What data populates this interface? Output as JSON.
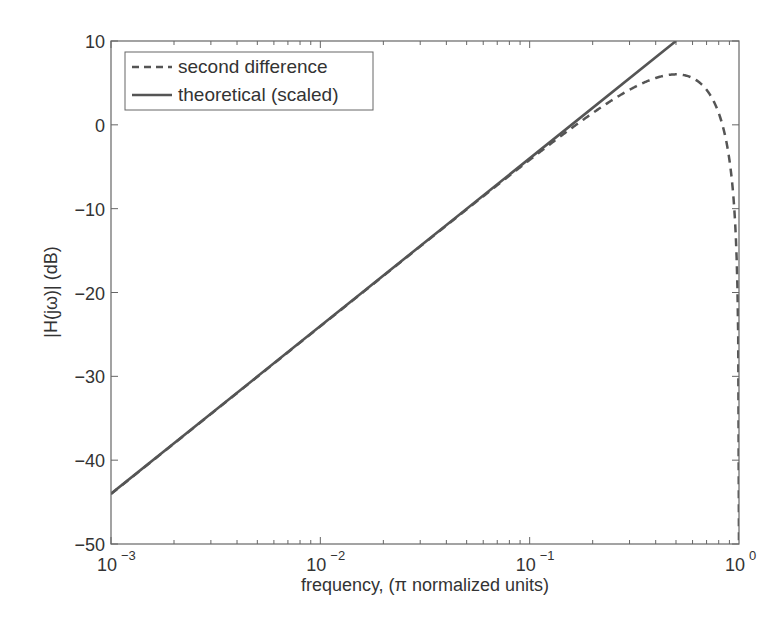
{
  "chart_data": {
    "type": "line",
    "title": "",
    "xlabel": "frequency, (π normalized units)",
    "ylabel": "|H(jω)| (dB)",
    "xscale": "log",
    "xlim": [
      0.001,
      1
    ],
    "ylim": [
      -50,
      10
    ],
    "x_ticks": [
      {
        "base": "10",
        "exp": "−3"
      },
      {
        "base": "10",
        "exp": "−2"
      },
      {
        "base": "10",
        "exp": "−1"
      },
      {
        "base": "10",
        "exp": "0"
      }
    ],
    "y_ticks": [
      "10",
      "0",
      "−10",
      "−20",
      "−30",
      "−40",
      "−50"
    ],
    "y_tick_values": [
      10,
      0,
      -10,
      -20,
      -30,
      -40,
      -50
    ],
    "grid": false,
    "legend_position": "upper left",
    "series": [
      {
        "name": "second difference",
        "style": "dashed",
        "formula": "20*log10(2*sin(pi*f))",
        "x": [
          0.001,
          0.002,
          0.005,
          0.01,
          0.02,
          0.05,
          0.1,
          0.15,
          0.2,
          0.3,
          0.4,
          0.5,
          0.6,
          0.7,
          0.8,
          0.9,
          0.95,
          0.98,
          0.99,
          0.995,
          1.0
        ],
        "values": [
          -44.0,
          -38.0,
          -30.1,
          -24.1,
          -18.0,
          -10.1,
          -4.2,
          -0.7,
          1.8,
          4.2,
          5.6,
          6.0,
          5.6,
          4.2,
          1.8,
          -4.2,
          -10.1,
          -18.0,
          -24.1,
          -30.1,
          -50
        ]
      },
      {
        "name": "theoretical (scaled)",
        "style": "solid",
        "formula": "20*log10(2*pi*f)",
        "x": [
          0.001,
          0.01,
          0.1,
          0.5
        ],
        "values": [
          -44.0,
          -24.0,
          -4.0,
          10.0
        ]
      }
    ]
  },
  "legend": {
    "items": [
      {
        "label": "second difference"
      },
      {
        "label": "theoretical (scaled)"
      }
    ]
  },
  "colors": {
    "line": "#555555",
    "axis": "#666666",
    "text": "#333333"
  }
}
